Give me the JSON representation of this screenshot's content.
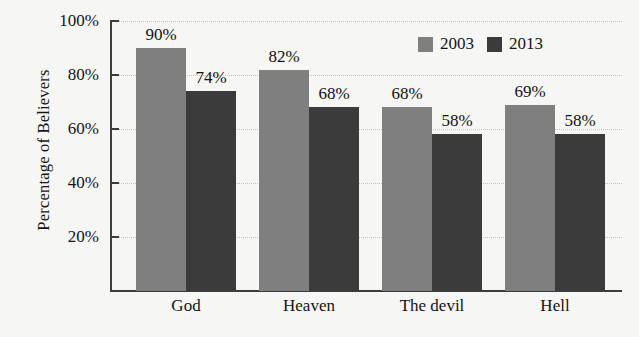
{
  "chart_data": {
    "type": "bar",
    "title": "",
    "subtitle": "",
    "xlabel": "",
    "ylabel": "Percentage of Believers",
    "categories": [
      "God",
      "Heaven",
      "The devil",
      "Hell"
    ],
    "series": [
      {
        "name": "2003",
        "color": "#7f7f7f",
        "values": [
          90,
          82,
          68,
          69
        ],
        "labels": [
          "90%",
          "82%",
          "68%",
          "69%"
        ]
      },
      {
        "name": "2013",
        "color": "#3b3b3b",
        "values": [
          74,
          68,
          58,
          58
        ],
        "labels": [
          "74%",
          "68%",
          "58%",
          "58%"
        ]
      }
    ],
    "ylim": [
      0,
      100
    ],
    "yticks": [
      20,
      40,
      60,
      80,
      100
    ],
    "ytick_labels": [
      "20%",
      "40%",
      "60%",
      "80%",
      "100%"
    ],
    "grid": true,
    "grid_style": "dotted",
    "legend_position": "top-right",
    "value_labels": true,
    "units": "percent"
  },
  "axes": {
    "y_title": "Percentage of Believers",
    "y_ticks": [
      {
        "value": 100,
        "label": "100%"
      },
      {
        "value": 80,
        "label": "80%"
      },
      {
        "value": 60,
        "label": "60%"
      },
      {
        "value": 40,
        "label": "40%"
      },
      {
        "value": 20,
        "label": "20%"
      }
    ],
    "x_ticks": [
      {
        "label": "God"
      },
      {
        "label": "Heaven"
      },
      {
        "label": "The devil"
      },
      {
        "label": "Hell"
      }
    ]
  },
  "legend": {
    "items": [
      {
        "label": "2003",
        "color": "#7f7f7f"
      },
      {
        "label": "2013",
        "color": "#3b3b3b"
      }
    ]
  },
  "colors": {
    "background": "#f6f6f4",
    "axis": "#3c3c3c",
    "grid": "#c3c3c3",
    "text": "#141414",
    "series_2003": "#7f7f7f",
    "series_2013": "#3b3b3b"
  }
}
